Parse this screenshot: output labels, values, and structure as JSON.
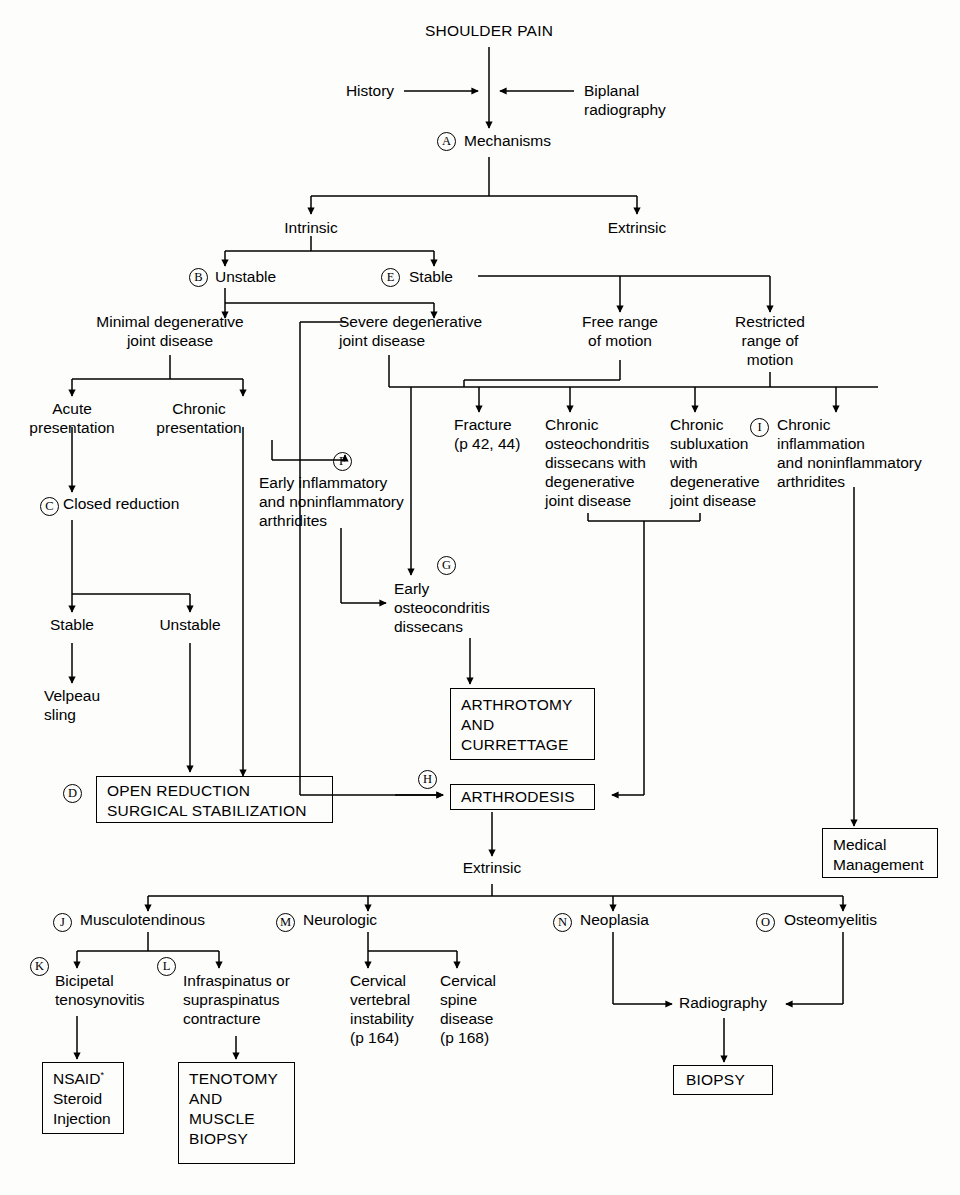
{
  "title": "SHOULDER PAIN",
  "diagram": {
    "type": "clinical-decision-flowchart",
    "root": "SHOULDER PAIN",
    "inputs": [
      "History",
      "Biplanal\nradiography"
    ],
    "nodes": {
      "root": "SHOULDER PAIN",
      "history": "History",
      "radiography": "Biplanal\nradiography",
      "mechanisms": "Mechanisms",
      "intrinsic": "Intrinsic",
      "extrinsic_top": "Extrinsic",
      "unstable_b": "Unstable",
      "stable_e": "Stable",
      "minimal_djd": "Minimal degenerative\njoint disease",
      "severe_djd": "Severe degenerative\njoint disease",
      "free_rom": "Free range\nof motion",
      "restricted_rom": "Restricted\nrange of\nmotion",
      "acute": "Acute\npresentation",
      "chronic": "Chronic\npresentation",
      "fracture": "Fracture\n(p 42, 44)",
      "chronic_ocd_djd": "Chronic\nosteochondritis\ndissecans with\ndegenerative\njoint disease",
      "chronic_sublux": "Chronic\nsubluxation\nwith\ndegenerative\njoint disease",
      "chronic_inflam": "Chronic\ninflammation\nand noninflammatory\narthridites",
      "closed_reduction": "Closed reduction",
      "early_inflam": "Early inflammatory\nand noninflammatory\narthridites",
      "early_ocd": "Early\nosteocondritis\ndissecans",
      "stable_low": "Stable",
      "unstable_low": "Unstable",
      "velpeau": "Velpeau\nsling",
      "extrinsic_low": "Extrinsic",
      "musculotendinous": "Musculotendinous",
      "neurologic": "Neurologic",
      "neoplasia": "Neoplasia",
      "osteomyelitis": "Osteomyelitis",
      "bicipetal": "Bicipetal\ntenosynovitis",
      "infraspinatus": "Infraspinatus or\nsupraspinatus\ncontracture",
      "cervical_vertebral": "Cervical\nvertebral\ninstability\n(p 164)",
      "cervical_spine": "Cervical\nspine\ndisease\n(p 168)",
      "radiography_low": "Radiography"
    },
    "boxes": {
      "arthrotomy": "ARTHROTOMY\nAND\nCURRETTAGE",
      "arthrodesis": "ARTHRODESIS",
      "open_reduction": "OPEN REDUCTION\nSURGICAL STABILIZATION",
      "medical_management": "Medical\nManagement",
      "nsaid": "NSAID",
      "nsaid_sup": "*",
      "nsaid_rest": "\nSteroid\nInjection",
      "tenotomy": "TENOTOMY\nAND\nMUSCLE\nBIOPSY",
      "biopsy": "BIOPSY"
    },
    "keys": {
      "A": "A",
      "B": "B",
      "C": "C",
      "D": "D",
      "E": "E",
      "F": "F",
      "G": "G",
      "H": "H",
      "I": "I",
      "J": "J",
      "K": "K",
      "L": "L",
      "M": "M",
      "N": "N",
      "O": "O"
    },
    "colors": {
      "line": "#000000",
      "text": "#000000",
      "background": "#fdfdfc"
    }
  }
}
